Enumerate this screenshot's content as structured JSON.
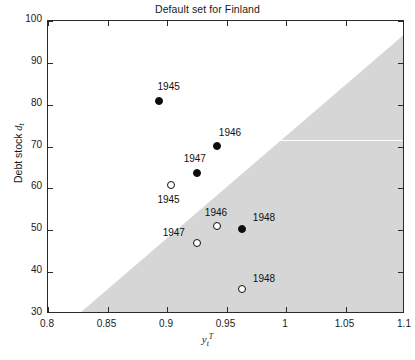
{
  "chart_data": {
    "type": "scatter",
    "title": "Default set for Finland",
    "xlabel": "y_t^T",
    "ylabel": "Debt stock d_t",
    "xlim": [
      0.8,
      1.1
    ],
    "ylim": [
      30,
      100
    ],
    "xticks": [
      0.8,
      0.85,
      0.9,
      0.95,
      1.0,
      1.05,
      1.1
    ],
    "xticklabels": [
      "0.8",
      "0.85",
      "0.9",
      "0.95",
      "1",
      "1.05",
      "1.1"
    ],
    "yticks": [
      30,
      40,
      50,
      60,
      70,
      80,
      90,
      100
    ],
    "yticklabels": [
      "30",
      "40",
      "50",
      "60",
      "70",
      "80",
      "90",
      "100"
    ],
    "grid": false,
    "legend": "none",
    "shaded_region": {
      "name": "default-set",
      "color": "#d6d6d6",
      "description": "Shaded region below/right of diagonal frontier denoting the default set",
      "frontier_points": [
        [
          0.828,
          30
        ],
        [
          1.1,
          96.5
        ]
      ]
    },
    "annotation_white_rule": {
      "y": 71.5,
      "x_from": 0.937,
      "x_to": 1.1
    },
    "series": [
      {
        "name": "filled",
        "marker": "filled-circle",
        "color": "#0d0d0d",
        "points": [
          {
            "label": "1945",
            "x": 0.893,
            "y": 81.0,
            "label_dx": 10,
            "label_dy": -15
          },
          {
            "label": "1946",
            "x": 0.942,
            "y": 70.2,
            "label_dx": 13,
            "label_dy": -14
          },
          {
            "label": "1947",
            "x": 0.925,
            "y": 63.8,
            "label_dx": -2,
            "label_dy": -15
          },
          {
            "label": "1948",
            "x": 0.963,
            "y": 50.4,
            "label_dx": 22,
            "label_dy": -12
          }
        ]
      },
      {
        "name": "open",
        "marker": "open-circle",
        "color": "#ffffff",
        "points": [
          {
            "label": "1945",
            "x": 0.903,
            "y": 60.8,
            "label_dx": -2,
            "label_dy": 14
          },
          {
            "label": "1946",
            "x": 0.942,
            "y": 51.0,
            "label_dx": -1,
            "label_dy": -14
          },
          {
            "label": "1947",
            "x": 0.925,
            "y": 47.0,
            "label_dx": -23,
            "label_dy": -11
          },
          {
            "label": "1948",
            "x": 0.963,
            "y": 36.0,
            "label_dx": 22,
            "label_dy": -11
          }
        ]
      }
    ]
  }
}
